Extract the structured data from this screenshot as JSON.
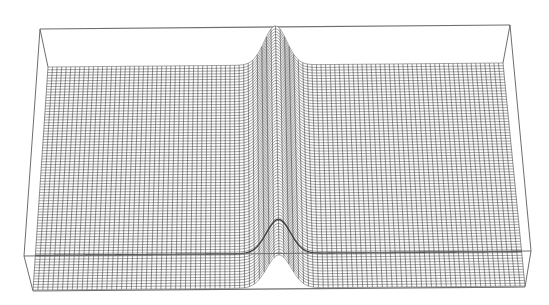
{
  "chart_data": {
    "type": "surface",
    "title": "",
    "xlabel": "",
    "ylabel": "",
    "zlabel": "",
    "style": "wireframe mesh",
    "grid_resolution": {
      "cols": 100,
      "rows": 40
    },
    "surface": {
      "description": "flat plane with a single narrow Gaussian ridge running front-to-back",
      "baseline_z": 0,
      "ridge": {
        "x_center_fraction": 0.5,
        "width_fraction": 0.035,
        "peak_height_fraction": 1.0
      }
    },
    "colors": {
      "mesh": "#2b2b2b",
      "box": "#6e6e6e",
      "background": "#ffffff"
    },
    "geometry": {
      "box_top_left": [
        40,
        29
      ],
      "box_top_right": [
        510,
        25
      ],
      "box_bottom_left_back": [
        24,
        256
      ],
      "box_bottom_right_back": [
        531,
        251
      ],
      "box_bottom_left_front": [
        33,
        291
      ],
      "box_bottom_right_front": [
        525,
        287
      ],
      "surface_back_left": [
        48,
        67
      ],
      "surface_back_right": [
        503,
        63
      ],
      "surface_front_left": [
        33,
        290
      ],
      "surface_front_right": [
        525,
        286
      ],
      "ridge_peak": [
        276,
        26
      ]
    }
  }
}
